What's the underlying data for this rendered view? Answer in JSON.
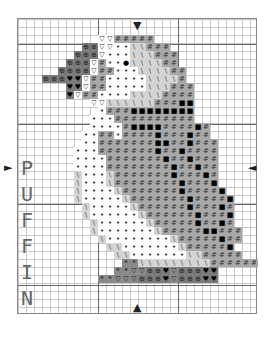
{
  "letters": [
    "P",
    "U",
    "F",
    "F",
    "I",
    "N"
  ],
  "grid": {
    "cols": 30,
    "rows": 37,
    "cell_px": 8,
    "major_every": 10
  },
  "colors": {
    "light": "#f4f4f4",
    "mid": "#a8a8a8",
    "lightgray": "#cfcfcf",
    "dark": "#7a7a7a",
    "black": "#111111"
  },
  "symbols": {
    "o": {
      "glyph": "•",
      "bg": "#ffffff",
      "fg": "#222"
    },
    "v": {
      "glyph": "▽",
      "bg": "#ffffff",
      "fg": "#333"
    },
    "#": {
      "glyph": "#",
      "bg": "#a8a8a8",
      "fg": "#333"
    },
    "\\": {
      "glyph": "\\",
      "bg": "#d4d4d4",
      "fg": "#444"
    },
    "B": {
      "glyph": "■",
      "bg": "#a8a8a8",
      "fg": "#000"
    },
    "X": {
      "glyph": "⊕",
      "bg": "#7a7a7a",
      "fg": "#222"
    },
    "H": {
      "glyph": "♥",
      "bg": "#7a7a7a",
      "fg": "#000"
    },
    "*": {
      "glyph": "*",
      "bg": "#8a8a8a",
      "fg": "#111"
    },
    "E": {
      "glyph": "●",
      "bg": "#ffffff",
      "fg": "#000"
    },
    "D": {
      "glyph": "▽",
      "bg": "#8a8a8a",
      "fg": "#222"
    }
  },
  "pattern": [
    "..............................",
    "..............................",
    "..........vv#####.............",
    "........XXvvoo\\\\###...........",
    ".......XXXvooo\\\\\\###..........",
    "......XXXv#ooE\\\\\\\\##..........",
    ".....XXXXv##ooo\\\\\\\\##.........",
    "...XXXHHv##ooooo\\\\\\\\#.........",
    "......HHv##ooooo\\\\\\###........",
    "......Hv##oooo\\\\\\\\####........",
    ".........vv\\\\\\\\\\\\###BB........",
    "..........o###BBBBBBBB........",
    ".........ooo##########........",
    ".........oooo#BBBB####B#......",
    "........oo##o####B###B##......",
    "........oo#######BB##B###.....",
    ".......ooo#######B##B####.....",
    ".......oooo#######B##B###.....",
    ".......oooo########B##B##.....",
    ".......\\ooo\\#######B###B#.....",
    ".......\\ooo\\########B###B.....",
    ".......\\oooo\\#######B####B....",
    ".......\\ooooo\\#######B####B...",
    "........\\ooooo\\######B###B#...",
    "........\\oooooo\\######B###B...",
    ".........\\oooooo\\#####B##B#...",
    ".........\\ooooooo\\#####BB###..",
    "..........\\oooooooo\\#####B##..",
    "...........\\\\ooooooo\\#####B...",
    "............\\\\ooooooo\\\\#####..",
    ".............**\\\\\\\\\\\\\\\\\\######.",
    "............**DDXXHDXXXHH.....",
    "..........**DDDXXXHDXXXHH.....",
    "..............................",
    "..............................",
    "..............................",
    ".............................."
  ],
  "arrows": {
    "top": "▼",
    "bottom": "▲",
    "left": "►",
    "right": "◄"
  }
}
